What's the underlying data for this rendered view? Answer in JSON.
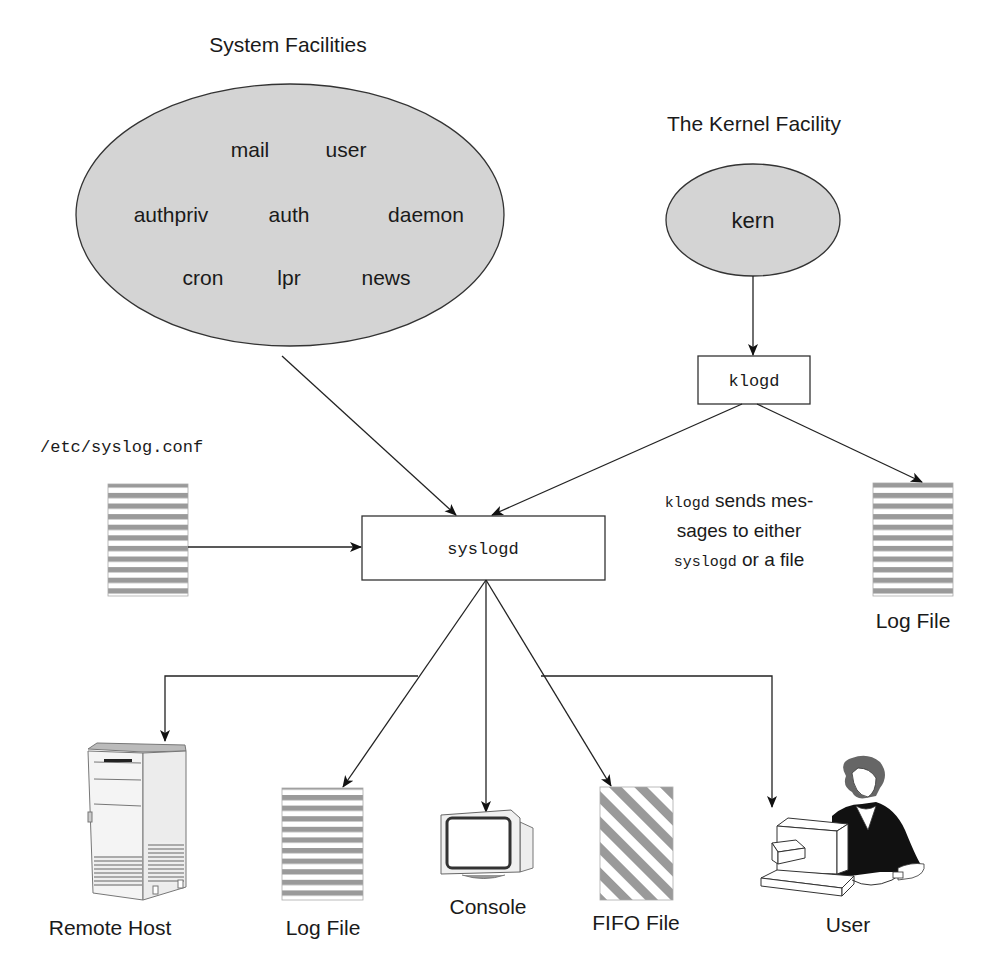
{
  "diagram": {
    "type": "flow",
    "groups": {
      "system_facilities": {
        "title": "System Facilities",
        "items": [
          "mail",
          "user",
          "authpriv",
          "auth",
          "daemon",
          "cron",
          "lpr",
          "news"
        ]
      },
      "kernel_facility": {
        "title": "The Kernel Facility",
        "items": [
          "kern"
        ]
      }
    },
    "nodes": {
      "klogd": "klogd",
      "syslogd": "syslogd",
      "config_file": "/etc/syslog.conf",
      "klogd_log_file": "Log File",
      "remote_host": "Remote Host",
      "log_file": "Log File",
      "console": "Console",
      "fifo_file": "FIFO File",
      "user": "User"
    },
    "annotation": {
      "line1_mono": "klogd",
      "line1_text": " sends mes-",
      "line2_text": "sages to either",
      "line3_mono": "syslogd",
      "line3_text": " or a file"
    },
    "edges": [
      {
        "from": "System Facilities",
        "to": "syslogd"
      },
      {
        "from": "kern",
        "to": "klogd"
      },
      {
        "from": "klogd",
        "to": "syslogd"
      },
      {
        "from": "klogd",
        "to": "Log File"
      },
      {
        "from": "/etc/syslog.conf",
        "to": "syslogd"
      },
      {
        "from": "syslogd",
        "to": "Remote Host"
      },
      {
        "from": "syslogd",
        "to": "Log File"
      },
      {
        "from": "syslogd",
        "to": "Console"
      },
      {
        "from": "syslogd",
        "to": "FIFO File"
      },
      {
        "from": "syslogd",
        "to": "User"
      }
    ],
    "colors": {
      "ellipse_fill": "#d4d4d4",
      "stripe_gray": "#9a9a9a",
      "line": "#222222"
    }
  }
}
